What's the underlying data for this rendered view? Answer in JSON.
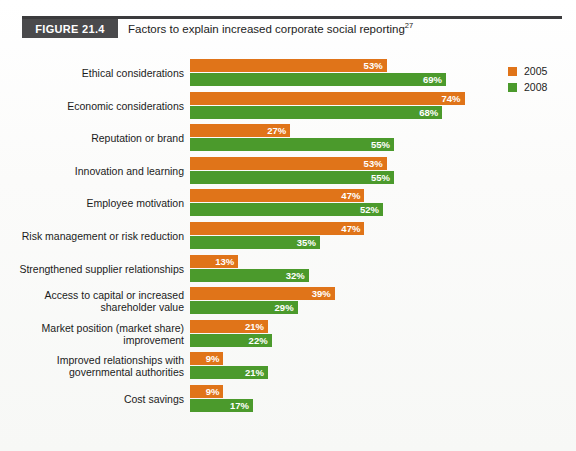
{
  "figure": {
    "badge": "FIGURE 21.4",
    "title": "Factors to explain increased corporate social reporting",
    "title_superscript": "27"
  },
  "legend": {
    "position": "top-right",
    "items": [
      {
        "label": "2005",
        "color": "#e07419"
      },
      {
        "label": "2008",
        "color": "#4b9a2c"
      }
    ]
  },
  "axis": {
    "ticks": [
      "0%",
      "10%",
      "20%",
      "30%",
      "40%",
      "50%",
      "60%",
      "70%",
      "80%",
      "90%",
      "100%"
    ]
  },
  "chart_data": {
    "type": "bar",
    "orientation": "horizontal",
    "title": "Factors to explain increased corporate social reporting",
    "xlabel": "",
    "ylabel": "",
    "xlim": [
      0,
      100
    ],
    "grid": false,
    "legend_position": "top-right",
    "value_suffix": "%",
    "categories": [
      "Ethical considerations",
      "Economic considerations",
      "Reputation or brand",
      "Innovation and learning",
      "Employee motivation",
      "Risk management or risk reduction",
      "Strengthened supplier relationships",
      "Access to capital or increased shareholder value",
      "Market position (market share) improvement",
      "Improved relationships with governmental authorities",
      "Cost savings"
    ],
    "category_lines": [
      [
        "Ethical considerations"
      ],
      [
        "Economic considerations"
      ],
      [
        "Reputation or brand"
      ],
      [
        "Innovation and learning"
      ],
      [
        "Employee motivation"
      ],
      [
        "Risk management or risk reduction"
      ],
      [
        "Strengthened supplier relationships"
      ],
      [
        "Access to capital or increased",
        "shareholder value"
      ],
      [
        "Market position (market share)",
        "improvement"
      ],
      [
        "Improved relationships with",
        "governmental authorities"
      ],
      [
        "Cost savings"
      ]
    ],
    "series": [
      {
        "name": "2005",
        "color": "#e07419",
        "values": [
          53,
          74,
          27,
          53,
          47,
          47,
          13,
          39,
          21,
          9,
          9
        ],
        "labels": [
          "53%",
          "74%",
          "27%",
          "53%",
          "47%",
          "47%",
          "13%",
          "39%",
          "21%",
          "9%",
          "9%"
        ]
      },
      {
        "name": "2008",
        "color": "#4b9a2c",
        "values": [
          69,
          68,
          55,
          55,
          52,
          35,
          32,
          29,
          22,
          21,
          17
        ],
        "labels": [
          "69%",
          "68%",
          "55%",
          "55%",
          "52%",
          "35%",
          "32%",
          "29%",
          "22%",
          "21%",
          "17%"
        ]
      }
    ]
  }
}
